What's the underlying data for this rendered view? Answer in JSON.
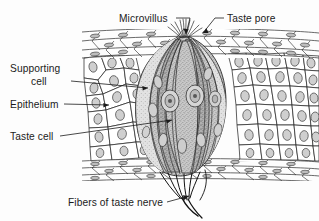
{
  "figure": {
    "background_color": "#fdfdfd",
    "ink_color": "#1b1b1b",
    "bud_fill_color": "#b9b9b9",
    "support_fill_color": "#d8d8d8",
    "nucleus_color": "#cfcfcf"
  },
  "labels": {
    "microvillus": "Microvillus",
    "taste_pore": "Taste pore",
    "supporting_cell_line1": "Supporting",
    "supporting_cell_line2": "cell",
    "epithelium": "Epithelium",
    "taste_cell": "Taste cell",
    "fibers_of_taste_nerve": "Fibers of taste nerve"
  },
  "structures": {
    "taste_bud": "taste-bud",
    "epithelium_block": "epithelium-block",
    "squamous_top_layer": "squamous-surface-layer",
    "basal_layer": "basal-cell-layer",
    "nerve_bundle": "taste-nerve-fiber-bundle",
    "microvilli_tuft": "microvilli-tuft",
    "taste_pore_opening": "taste-pore-opening"
  }
}
